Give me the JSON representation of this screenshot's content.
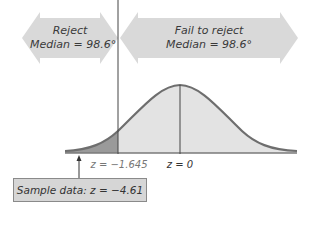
{
  "regions": {
    "reject": {
      "line1": "Reject",
      "line2": "Median = 98.6°"
    },
    "fail_to_reject": {
      "line1": "Fail to reject",
      "line2": "Median = 98.6°"
    }
  },
  "axis": {
    "critical_label": "z = −1.645",
    "center_label": "z = 0"
  },
  "sample": {
    "label": "Sample data: z = −4.61"
  },
  "colors": {
    "arrow_fill": "#d9d9d9",
    "curve": "#6e6e6e",
    "area_fill": "#e3e3e3",
    "critical_fill": "#9a9a9a",
    "line": "#444444"
  }
}
